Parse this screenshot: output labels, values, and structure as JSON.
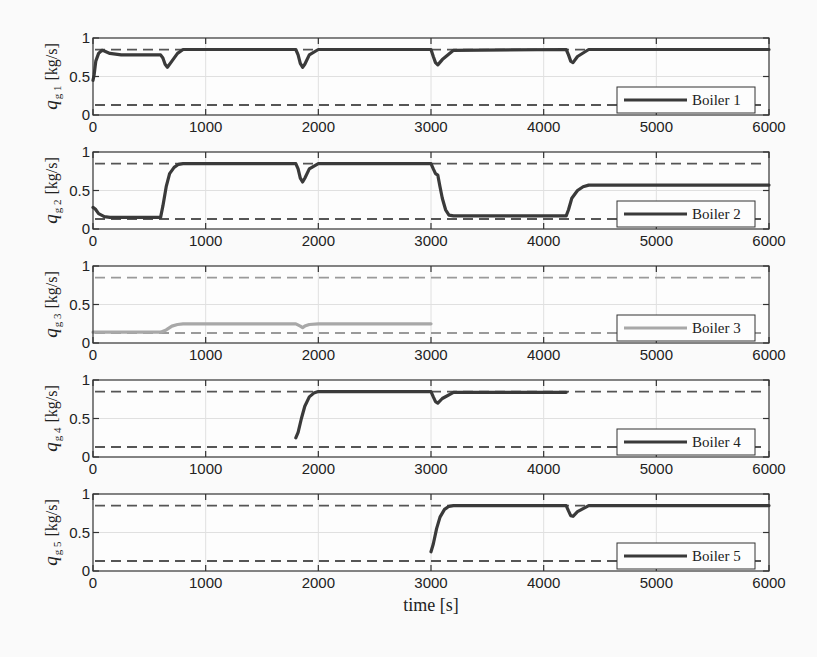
{
  "figure": {
    "xlabel": "time [s]"
  },
  "chart_data": [
    {
      "type": "line",
      "title": "",
      "ylabel": "q_g 1 [kg/s]",
      "ylabel_main": "q",
      "ylabel_sub": "g 1",
      "ylabel_unit": "[kg/s]",
      "xlabel": "",
      "xlim": [
        0,
        6000
      ],
      "ylim": [
        0,
        1
      ],
      "xticks": [
        0,
        1000,
        2000,
        3000,
        4000,
        5000,
        6000
      ],
      "yticks": [
        0,
        0.5,
        1
      ],
      "ytick_labels": [
        "0",
        "0.5",
        "1"
      ],
      "grid": true,
      "legend": {
        "label": "Boiler 1",
        "position": "lower right"
      },
      "bounds": {
        "upper": 0.85,
        "lower": 0.13,
        "color": "#555555"
      },
      "series": [
        {
          "name": "Boiler 1",
          "color": "#3a3a3a",
          "x": [
            0,
            10,
            25,
            50,
            80,
            100,
            150,
            250,
            400,
            600,
            620,
            640,
            660,
            700,
            750,
            800,
            1800,
            1820,
            1840,
            1860,
            1880,
            1920,
            2000,
            3000,
            3020,
            3040,
            3060,
            3100,
            3200,
            4200,
            4220,
            4240,
            4260,
            4300,
            4400,
            6000
          ],
          "y": [
            0.45,
            0.52,
            0.7,
            0.8,
            0.84,
            0.83,
            0.8,
            0.78,
            0.78,
            0.78,
            0.74,
            0.66,
            0.62,
            0.7,
            0.8,
            0.85,
            0.85,
            0.78,
            0.67,
            0.62,
            0.66,
            0.78,
            0.85,
            0.85,
            0.76,
            0.68,
            0.65,
            0.72,
            0.84,
            0.85,
            0.78,
            0.7,
            0.68,
            0.76,
            0.85,
            0.85
          ]
        }
      ]
    },
    {
      "type": "line",
      "title": "",
      "ylabel": "q_g 2 [kg/s]",
      "ylabel_main": "q",
      "ylabel_sub": "g 2",
      "ylabel_unit": "[kg/s]",
      "xlabel": "",
      "xlim": [
        0,
        6000
      ],
      "ylim": [
        0,
        1
      ],
      "xticks": [
        0,
        1000,
        2000,
        3000,
        4000,
        5000,
        6000
      ],
      "yticks": [
        0,
        0.5,
        1
      ],
      "ytick_labels": [
        "0",
        "0.5",
        "1"
      ],
      "grid": true,
      "legend": {
        "label": "Boiler 2",
        "position": "lower right"
      },
      "bounds": {
        "upper": 0.85,
        "lower": 0.13,
        "color": "#555555"
      },
      "series": [
        {
          "name": "Boiler 2",
          "color": "#3a3a3a",
          "x": [
            0,
            20,
            50,
            100,
            150,
            300,
            600,
            620,
            650,
            680,
            720,
            760,
            800,
            1800,
            1820,
            1840,
            1860,
            1880,
            1920,
            2000,
            3000,
            3020,
            3040,
            3060,
            3080,
            3100,
            3130,
            3160,
            3200,
            4200,
            4220,
            4250,
            4300,
            4350,
            4400,
            6000
          ],
          "y": [
            0.28,
            0.26,
            0.2,
            0.16,
            0.15,
            0.15,
            0.15,
            0.3,
            0.55,
            0.72,
            0.8,
            0.84,
            0.85,
            0.85,
            0.78,
            0.66,
            0.61,
            0.66,
            0.78,
            0.85,
            0.85,
            0.78,
            0.72,
            0.7,
            0.55,
            0.4,
            0.25,
            0.18,
            0.17,
            0.17,
            0.25,
            0.4,
            0.5,
            0.55,
            0.57,
            0.57
          ]
        }
      ]
    },
    {
      "type": "line",
      "title": "",
      "ylabel": "q_g 3 [kg/s]",
      "ylabel_main": "q",
      "ylabel_sub": "g 3",
      "ylabel_unit": "[kg/s]",
      "xlabel": "",
      "xlim": [
        0,
        6000
      ],
      "ylim": [
        0,
        1
      ],
      "xticks": [
        0,
        1000,
        2000,
        3000,
        4000,
        5000,
        6000
      ],
      "yticks": [
        0,
        0.5,
        1
      ],
      "ytick_labels": [
        "0",
        "0.5",
        "1"
      ],
      "grid": true,
      "legend": {
        "label": "Boiler 3",
        "position": "lower right"
      },
      "bounds": {
        "upper": 0.85,
        "lower": 0.13,
        "color": "#9a9a9a"
      },
      "series": [
        {
          "name": "Boiler 3",
          "color": "#a8a8a8",
          "x": [
            0,
            600,
            650,
            700,
            750,
            800,
            1800,
            1840,
            1860,
            1880,
            1920,
            2000,
            3000
          ],
          "y": [
            0.14,
            0.14,
            0.17,
            0.22,
            0.24,
            0.25,
            0.25,
            0.22,
            0.2,
            0.22,
            0.24,
            0.25,
            0.25
          ]
        }
      ]
    },
    {
      "type": "line",
      "title": "",
      "ylabel": "q_g 4 [kg/s]",
      "ylabel_main": "q",
      "ylabel_sub": "g 4",
      "ylabel_unit": "[kg/s]",
      "xlabel": "",
      "xlim": [
        0,
        6000
      ],
      "ylim": [
        0,
        1
      ],
      "xticks": [
        0,
        1000,
        2000,
        3000,
        4000,
        5000,
        6000
      ],
      "yticks": [
        0,
        0.5,
        1
      ],
      "ytick_labels": [
        "0",
        "0.5",
        "1"
      ],
      "grid": true,
      "legend": {
        "label": "Boiler 4",
        "position": "lower right"
      },
      "bounds": {
        "upper": 0.85,
        "lower": 0.13,
        "color": "#555555"
      },
      "series": [
        {
          "name": "Boiler 4",
          "color": "#3a3a3a",
          "x": [
            1800,
            1820,
            1850,
            1880,
            1920,
            1960,
            2000,
            3000,
            3020,
            3040,
            3060,
            3100,
            3200,
            4200
          ],
          "y": [
            0.25,
            0.32,
            0.5,
            0.66,
            0.78,
            0.83,
            0.85,
            0.85,
            0.78,
            0.72,
            0.7,
            0.76,
            0.84,
            0.84
          ]
        }
      ]
    },
    {
      "type": "line",
      "title": "",
      "ylabel": "q_g 5 [kg/s]",
      "ylabel_main": "q",
      "ylabel_sub": "g 5",
      "ylabel_unit": "[kg/s]",
      "xlabel": "time [s]",
      "xlim": [
        0,
        6000
      ],
      "ylim": [
        0,
        1
      ],
      "xticks": [
        0,
        1000,
        2000,
        3000,
        4000,
        5000,
        6000
      ],
      "yticks": [
        0,
        0.5,
        1
      ],
      "ytick_labels": [
        "0",
        "0.5",
        "1"
      ],
      "grid": true,
      "legend": {
        "label": "Boiler 5",
        "position": "lower right"
      },
      "bounds": {
        "upper": 0.85,
        "lower": 0.13,
        "color": "#555555"
      },
      "series": [
        {
          "name": "Boiler 5",
          "color": "#3a3a3a",
          "x": [
            3000,
            3020,
            3050,
            3080,
            3120,
            3160,
            3200,
            4200,
            4220,
            4240,
            4260,
            4300,
            4400,
            6000
          ],
          "y": [
            0.25,
            0.35,
            0.55,
            0.7,
            0.8,
            0.84,
            0.85,
            0.85,
            0.78,
            0.72,
            0.71,
            0.77,
            0.85,
            0.85
          ]
        }
      ]
    }
  ]
}
